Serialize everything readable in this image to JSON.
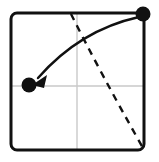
{
  "figure": {
    "canvas": {
      "width": 159,
      "height": 162,
      "background": "#ffffff"
    },
    "frame": {
      "name": "phase-plane-border",
      "x": 11,
      "y": 13,
      "width": 133,
      "height": 137,
      "corner_radius": 6,
      "stroke_color": "#111111",
      "stroke_width": 3,
      "fill": "none"
    },
    "gridlines": {
      "color": "#c9c9c9",
      "stroke_width": 1.4,
      "vertical": {
        "name": "vertical-axis-line",
        "x": 77,
        "y1": 14,
        "y2": 149
      },
      "horizontal": {
        "name": "horizontal-axis-line",
        "y": 86,
        "x1": 12,
        "x2": 143
      }
    },
    "dashed_line": {
      "name": "nullcline-dashed-line",
      "color": "#111111",
      "stroke_width": 2.4,
      "dash_pattern": "7 6",
      "path": "M 71 14 Q 100 72 143 148"
    },
    "trajectory": {
      "name": "trajectory-curve-arrow",
      "color": "#111111",
      "stroke_width": 2.4,
      "path": "M 139 17 Q 80 30 38 78",
      "arrowhead": {
        "name": "trajectory-arrowhead",
        "points": "32 85 47 75 44 88",
        "color": "#111111"
      }
    },
    "points": [
      {
        "name": "equilibrium-point-top-right",
        "label": "source point",
        "cx": 143,
        "cy": 14,
        "r": 7.5,
        "color": "#111111"
      },
      {
        "name": "equilibrium-point-left",
        "label": "target point",
        "cx": 29,
        "cy": 85,
        "r": 7.5,
        "color": "#111111"
      }
    ]
  }
}
